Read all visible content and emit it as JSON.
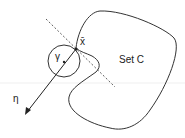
{
  "diagram": {
    "set_label": "Set C",
    "point_label": "x̄",
    "circle_label": "γ",
    "vector_label": "η",
    "stroke_color": "#333333",
    "guide_line_color": "#eeeeee"
  }
}
